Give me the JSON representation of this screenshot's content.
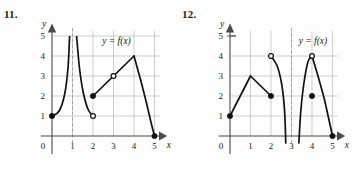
{
  "page": {
    "background_color": "#fdfdfc",
    "ink_color": "#111111",
    "grid_color": "#b9b9b9",
    "axis_color": "#4a4a4a"
  },
  "problems": [
    {
      "number": "11.",
      "chart_data": {
        "type": "line",
        "title": "",
        "curve_label": "y = f(x)",
        "xlabel": "x",
        "ylabel": "y",
        "xlim": [
          0,
          5.6
        ],
        "ylim": [
          0,
          5.6
        ],
        "xticks": [
          0,
          1,
          2,
          3,
          4,
          5
        ],
        "xtick_labels": [
          "0",
          "1",
          "2",
          "3",
          "4",
          "5"
        ],
        "yticks": [
          1,
          2,
          3,
          4,
          5
        ],
        "ytick_labels": [
          "1",
          "2",
          "3",
          "4",
          "5"
        ],
        "grid": true,
        "origin_label": "0",
        "vertical_asymptotes": [
          1
        ],
        "description": "Piecewise graph with a vertical asymptote at x = 1; branch from (0,1) rising to +infinity, branch falling from +infinity to an open circle at (2,1), a straight segment from filled (2,2) through open (3,3) to a corner at (4,4), then a concave curve down to filled (5,0).",
        "segments": [
          {
            "name": "left-branch-to-asymptote",
            "kind": "curve",
            "points": [
              [
                0,
                1
              ],
              [
                0.35,
                1.25
              ],
              [
                0.62,
                2.1
              ],
              [
                0.78,
                3.4
              ],
              [
                0.86,
                5
              ]
            ],
            "start_marker": "filled",
            "end_marker": "none"
          },
          {
            "name": "right-branch-from-asymptote",
            "kind": "curve",
            "points": [
              [
                1.2,
                5
              ],
              [
                1.34,
                3.4
              ],
              [
                1.52,
                2.2
              ],
              [
                1.75,
                1.35
              ],
              [
                2,
                1
              ]
            ],
            "start_marker": "none",
            "end_marker": "open"
          },
          {
            "name": "rising-straight-segment",
            "kind": "line",
            "points": [
              [
                2,
                2
              ],
              [
                3,
                3
              ],
              [
                4,
                4
              ]
            ],
            "start_marker": "filled",
            "end_marker": "none"
          },
          {
            "name": "descending-curve-to-x-axis",
            "kind": "curve",
            "points": [
              [
                4,
                4
              ],
              [
                4.35,
                2.7
              ],
              [
                4.62,
                1.6
              ],
              [
                4.85,
                0.6
              ],
              [
                5,
                0
              ]
            ],
            "start_marker": "none",
            "end_marker": "filled"
          }
        ],
        "filled_points": [
          [
            0,
            1
          ],
          [
            2,
            2
          ],
          [
            5,
            0
          ]
        ],
        "open_points": [
          [
            2,
            1
          ],
          [
            3,
            3
          ]
        ]
      }
    },
    {
      "number": "12.",
      "chart_data": {
        "type": "line",
        "title": "",
        "curve_label": "y = f(x)",
        "xlabel": "x",
        "ylabel": "y",
        "xlim": [
          0,
          5.6
        ],
        "ylim": [
          0,
          5.6
        ],
        "xticks": [
          0,
          1,
          2,
          3,
          4,
          5
        ],
        "xtick_labels": [
          "0",
          "1",
          "2",
          "3",
          "4",
          "5"
        ],
        "yticks": [
          1,
          2,
          3,
          4,
          5
        ],
        "ytick_labels": [
          "1",
          "2",
          "3",
          "4",
          "5"
        ],
        "grid": true,
        "origin_label": "0",
        "vertical_asymptotes": [
          3
        ],
        "description": "Piecewise graph with a vertical asymptote at x = 3; straight segments from (0,1) up to (1,3) then down to filled (2,2); a branch from open circle (2,4) plunging to -infinity near x = 2.7; a branch rising from -infinity near x = 3.4 to open circle (4,4) then falling to filled (5,0); isolated filled point at (4,2).",
        "segments": [
          {
            "name": "rising-straight-segment",
            "kind": "line",
            "points": [
              [
                0,
                1
              ],
              [
                1,
                3
              ]
            ],
            "start_marker": "filled",
            "end_marker": "none"
          },
          {
            "name": "falling-straight-segment",
            "kind": "line",
            "points": [
              [
                1,
                3
              ],
              [
                2,
                2
              ]
            ],
            "start_marker": "none",
            "end_marker": "filled"
          },
          {
            "name": "left-branch-to-negative-infinity",
            "kind": "curve",
            "points": [
              [
                2,
                4
              ],
              [
                2.3,
                3.5
              ],
              [
                2.52,
                2.6
              ],
              [
                2.66,
                1.3
              ],
              [
                2.72,
                -0.35
              ]
            ],
            "start_marker": "open",
            "end_marker": "none"
          },
          {
            "name": "right-branch-from-negative-infinity",
            "kind": "curve",
            "points": [
              [
                3.36,
                -0.35
              ],
              [
                3.45,
                1.2
              ],
              [
                3.6,
                2.6
              ],
              [
                3.8,
                3.7
              ],
              [
                4,
                4
              ]
            ],
            "start_marker": "none",
            "end_marker": "open"
          },
          {
            "name": "descending-curve-to-x-axis",
            "kind": "curve",
            "points": [
              [
                4,
                4
              ],
              [
                4.32,
                2.9
              ],
              [
                4.6,
                1.85
              ],
              [
                4.85,
                0.7
              ],
              [
                5,
                0
              ]
            ],
            "start_marker": "none",
            "end_marker": "filled"
          }
        ],
        "filled_points": [
          [
            0,
            1
          ],
          [
            2,
            2
          ],
          [
            4,
            2
          ],
          [
            5,
            0
          ]
        ],
        "open_points": [
          [
            2,
            4
          ],
          [
            4,
            4
          ]
        ]
      }
    }
  ]
}
